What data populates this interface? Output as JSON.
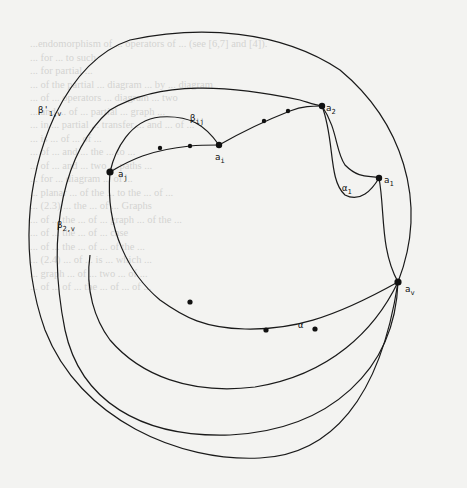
{
  "figure": {
    "type": "planar graph diagram",
    "vertices": [
      {
        "id": "a_2",
        "label": "a",
        "sub": "2"
      },
      {
        "id": "a_i",
        "label": "a",
        "sub": "i"
      },
      {
        "id": "a_j",
        "label": "a",
        "sub": "j"
      },
      {
        "id": "a_1",
        "label": "a",
        "sub": "1"
      },
      {
        "id": "a_v",
        "label": "a",
        "sub": "v"
      }
    ],
    "edge_labels": [
      {
        "id": "beta_ij",
        "label": "β",
        "sub": "ij"
      },
      {
        "id": "beta_1v",
        "label": "β'",
        "sub": "1,v"
      },
      {
        "id": "beta_2v",
        "label": "β",
        "sub": "2,v"
      },
      {
        "id": "alpha_1",
        "label": "α",
        "sub": "1"
      },
      {
        "id": "alpha",
        "label": "α",
        "sub": ""
      }
    ]
  },
  "background_text": [
    "...endomorphism of ... operators of ... (see [6,7] and [4]).",
    "... for ... to such",
    "... for partial ...",
    "... of the partial ... diagram ... by ... diagram",
    "... of ... operators ... diagram ... two",
    "... and ... of ... partial ... graph ...",
    "... in ... partial ... transfer ... and ... of ...",
    "... is ... of ... of ...",
    "... of ... and ... the ... to ...",
    "... of ... and ... two ... paths ...",
    "... for ... diagram ... of ...",
    "... planar ... of the ... to the ... of ...",
    "... (2.3) ... the ... of ... Graphs",
    "... of ... the ... of ... graph ... of the ...",
    "... of ... the ... of ... case",
    "... of ... the ... of ... of the ...",
    "... (2.4) ... of ... is ... which ...",
    "... graph ... of ... two ... of ...",
    "... of ... of ... the ... of ... of ..."
  ]
}
